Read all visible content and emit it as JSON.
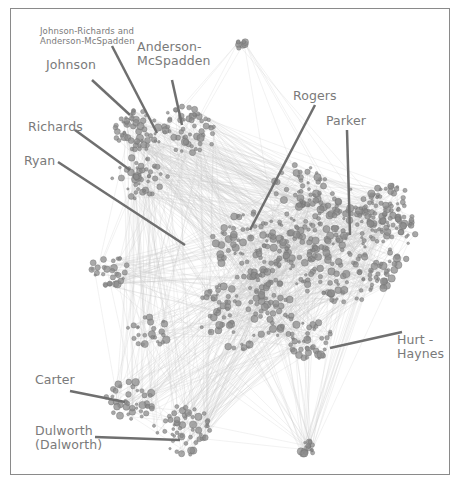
{
  "figure": {
    "type": "network-graph",
    "style": {
      "node_color": "#8c8c8c",
      "node_stroke": "#6e6e6e",
      "edge_color": "#c8c8c8",
      "label_color": "#7a7a7a",
      "leader_line_color": "#6f6f6f",
      "frame_color": "#8a8a8a"
    }
  },
  "labels": {
    "johnson_richards": {
      "line1": "Johnson-Richards and",
      "line2": "Anderson-McSpadden"
    },
    "johnson": {
      "text": "Johnson"
    },
    "anderson": {
      "line1": "Anderson-",
      "line2": "McSpadden"
    },
    "rogers": {
      "text": "Rogers"
    },
    "parker": {
      "text": "Parker"
    },
    "richards": {
      "text": "Richards"
    },
    "ryan": {
      "text": "Ryan"
    },
    "hurt": {
      "line1": "Hurt -",
      "line2": "Haynes"
    },
    "carter": {
      "text": "Carter"
    },
    "dulworth": {
      "line1": "Dulworth",
      "line2": "(Dalworth)"
    }
  },
  "clusters": [
    {
      "name": "Johnson",
      "cx": 140,
      "cy": 130,
      "r": 22,
      "n": 55
    },
    {
      "name": "Anderson-McSpadden",
      "cx": 188,
      "cy": 130,
      "r": 24,
      "n": 55
    },
    {
      "name": "Richards",
      "cx": 140,
      "cy": 178,
      "r": 22,
      "n": 45
    },
    {
      "name": "Rogers-core",
      "cx": 255,
      "cy": 245,
      "r": 35,
      "n": 90
    },
    {
      "name": "Parker",
      "cx": 345,
      "cy": 245,
      "r": 58,
      "n": 260
    },
    {
      "name": "Parker-east",
      "cx": 390,
      "cy": 210,
      "r": 25,
      "n": 60
    },
    {
      "name": "Rogers-upper",
      "cx": 300,
      "cy": 185,
      "r": 22,
      "n": 40
    },
    {
      "name": "South-central",
      "cx": 245,
      "cy": 310,
      "r": 40,
      "n": 110
    },
    {
      "name": "Hurt-Haynes",
      "cx": 310,
      "cy": 340,
      "r": 20,
      "n": 40
    },
    {
      "name": "West",
      "cx": 110,
      "cy": 270,
      "r": 16,
      "n": 30
    },
    {
      "name": "Carter",
      "cx": 130,
      "cy": 400,
      "r": 20,
      "n": 40
    },
    {
      "name": "Dulworth",
      "cx": 185,
      "cy": 430,
      "r": 25,
      "n": 55
    },
    {
      "name": "Bottom",
      "cx": 307,
      "cy": 448,
      "r": 8,
      "n": 18
    },
    {
      "name": "Top",
      "cx": 240,
      "cy": 45,
      "r": 6,
      "n": 8
    },
    {
      "name": "Mid-left",
      "cx": 150,
      "cy": 330,
      "r": 18,
      "n": 25
    }
  ]
}
